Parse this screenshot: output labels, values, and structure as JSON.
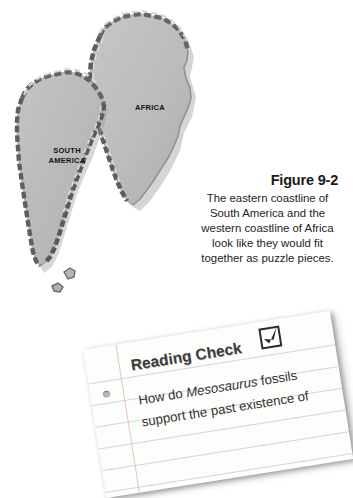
{
  "page": {
    "background_color": "#ffffff",
    "width": 341,
    "height": 456
  },
  "figure": {
    "title": "Figure 9-2",
    "caption": "The eastern coastline of South America and the western coastline of Africa look like they would fit together as puzzle pieces.",
    "caption_lines": [
      "The eastern coastline",
      "of South America and",
      "the western coastline of",
      "Africa look like they would",
      "fit together as puzzle",
      "pieces."
    ],
    "illustration": {
      "type": "continental-fit-puzzle-map",
      "continent_fill_color": "#bdbdbd",
      "continent_edge_color": "#5a5a5a",
      "labels": [
        {
          "name": "africa",
          "text": "AFRICA"
        },
        {
          "name": "south-america",
          "text": "SOUTH\nAMERICA"
        }
      ]
    }
  },
  "reading_check": {
    "heading": "Reading Check",
    "checkbox_icon": "checkbox-checked-icon",
    "question_prefix": "How do ",
    "question_species": "Mesosaurus",
    "question_suffix": " fossils support the past existence of",
    "question_full": "How do Mesosaurus fossils support the past existence of",
    "paper_color": "#fdfdfb",
    "rule_color": "#c9cfd6",
    "margin_line_color": "#e0b9bd"
  }
}
